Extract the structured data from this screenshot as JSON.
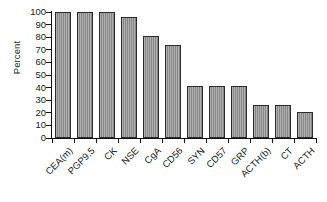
{
  "chart_data": {
    "type": "bar",
    "title": "",
    "xlabel": "",
    "ylabel": "Percent",
    "ylim": [
      0,
      100
    ],
    "yticks": [
      0,
      10,
      20,
      30,
      40,
      50,
      60,
      70,
      80,
      90,
      100
    ],
    "grid": false,
    "legend": false,
    "bar_color": "#8e8e8e",
    "bar_edge_color": "#2b2b2b",
    "categories": [
      "CEA(m)",
      "PGP9.5",
      "CK",
      "NSE",
      "CgA",
      "CD56",
      "SYN",
      "CD57",
      "GRP",
      "ACTH(b)",
      "CT",
      "ACTH"
    ],
    "values": [
      100,
      100,
      100,
      96,
      81,
      74,
      41,
      41,
      41,
      26,
      26,
      21
    ]
  }
}
